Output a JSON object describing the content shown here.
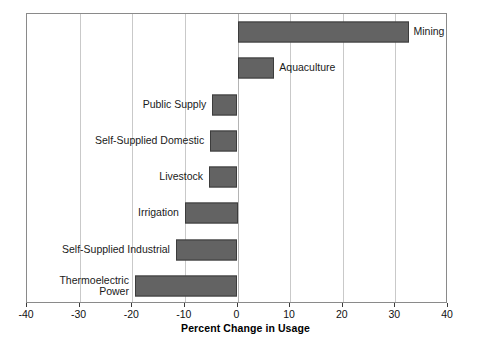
{
  "chart_data": {
    "type": "bar",
    "orientation": "horizontal",
    "title": "",
    "xlabel": "Percent Change in Usage",
    "ylabel": "",
    "xlim": [
      -40,
      40
    ],
    "xticks": [
      -40,
      -30,
      -20,
      -10,
      0,
      10,
      20,
      30,
      40
    ],
    "xticklabels": [
      "-40",
      "-30",
      "-20",
      "-10",
      "0",
      "10",
      "20",
      "30",
      "40"
    ],
    "grid": true,
    "grid_axis": "x",
    "legend": false,
    "bar_color": "#636363",
    "bar_edge_color": "#3c3c3c",
    "categories": [
      "Mining",
      "Aquaculture",
      "Public Supply",
      "Self-Supplied Domestic",
      "Livestock",
      "Irrigation",
      "Self-Supplied Industrial",
      "Thermoelectric Power"
    ],
    "values": [
      32.5,
      7,
      -4.8,
      -5.2,
      -5.4,
      -10,
      -11.7,
      -19.5
    ],
    "bars": [
      {
        "label": "Mining",
        "label_lines": [
          "Mining"
        ],
        "value": 32.5,
        "label_side": "right"
      },
      {
        "label": "Aquaculture",
        "label_lines": [
          "Aquaculture"
        ],
        "value": 7,
        "label_side": "right"
      },
      {
        "label": "Public Supply",
        "label_lines": [
          "Public Supply"
        ],
        "value": -4.8,
        "label_side": "left"
      },
      {
        "label": "Self-Supplied Domestic",
        "label_lines": [
          "Self-Supplied Domestic"
        ],
        "value": -5.2,
        "label_side": "left"
      },
      {
        "label": "Livestock",
        "label_lines": [
          "Livestock"
        ],
        "value": -5.4,
        "label_side": "left"
      },
      {
        "label": "Irrigation",
        "label_lines": [
          "Irrigation"
        ],
        "value": -10,
        "label_side": "left"
      },
      {
        "label": "Self-Supplied Industrial",
        "label_lines": [
          "Self-Supplied Industrial"
        ],
        "value": -11.7,
        "label_side": "left"
      },
      {
        "label": "Thermoelectric Power",
        "label_lines": [
          "Thermoelectric",
          "Power"
        ],
        "value": -19.5,
        "label_side": "left"
      }
    ]
  }
}
